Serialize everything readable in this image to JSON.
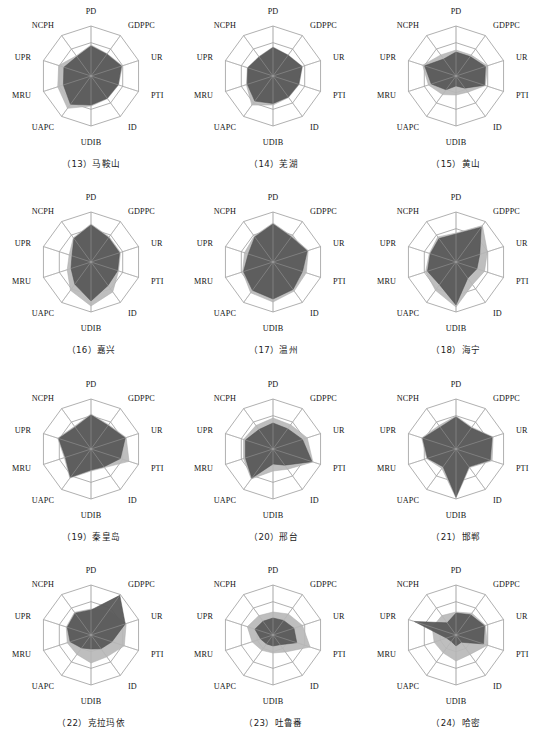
{
  "figure": {
    "type": "radar-grid",
    "rows": 4,
    "cols": 3,
    "axes": [
      "PD",
      "GDPPC",
      "UR",
      "PTI",
      "ID",
      "UDIB",
      "UAPC",
      "MRU",
      "UPR",
      "NCPH"
    ],
    "rings": 3,
    "colors": {
      "series_light": "#b9b9b9",
      "series_dark": "#585858",
      "grid": "#8e8e8e",
      "text": "#1a1a1a",
      "background": "#ffffff"
    },
    "series_names": [
      "light-series",
      "dark-series"
    ]
  },
  "chart_data": [
    {
      "type": "radar",
      "title": "（13）马鞍山",
      "index": "13",
      "name": "马鞍山",
      "categories": [
        "PD",
        "GDPPC",
        "UR",
        "PTI",
        "ID",
        "UDIB",
        "UAPC",
        "MRU",
        "UPR",
        "NCPH"
      ],
      "rmax": 1.0,
      "series": [
        {
          "name": "light-series",
          "values": [
            0.62,
            0.55,
            0.66,
            0.58,
            0.56,
            0.6,
            0.8,
            0.7,
            0.68,
            0.5
          ]
        },
        {
          "name": "dark-series",
          "values": [
            0.6,
            0.54,
            0.64,
            0.57,
            0.55,
            0.58,
            0.7,
            0.58,
            0.57,
            0.48
          ]
        }
      ]
    },
    {
      "type": "radar",
      "title": "（14）芜湖",
      "index": "14",
      "name": "芜湖",
      "categories": [
        "PD",
        "GDPPC",
        "UR",
        "PTI",
        "ID",
        "UDIB",
        "UAPC",
        "MRU",
        "UPR",
        "NCPH"
      ],
      "rmax": 1.0,
      "series": [
        {
          "name": "light-series",
          "values": [
            0.58,
            0.52,
            0.62,
            0.55,
            0.53,
            0.58,
            0.72,
            0.56,
            0.54,
            0.48
          ]
        },
        {
          "name": "dark-series",
          "values": [
            0.57,
            0.51,
            0.61,
            0.54,
            0.52,
            0.55,
            0.62,
            0.54,
            0.53,
            0.47
          ]
        }
      ]
    },
    {
      "type": "radar",
      "title": "（15）黄山",
      "index": "15",
      "name": "黄山",
      "categories": [
        "PD",
        "GDPPC",
        "UR",
        "PTI",
        "ID",
        "UDIB",
        "UAPC",
        "MRU",
        "UPR",
        "NCPH"
      ],
      "rmax": 1.0,
      "series": [
        {
          "name": "light-series",
          "values": [
            0.52,
            0.52,
            0.66,
            0.62,
            0.4,
            0.38,
            0.46,
            0.58,
            0.7,
            0.52
          ]
        },
        {
          "name": "dark-series",
          "values": [
            0.48,
            0.48,
            0.62,
            0.6,
            0.3,
            0.2,
            0.34,
            0.52,
            0.66,
            0.42
          ]
        }
      ]
    },
    {
      "type": "radar",
      "title": "（16）嘉兴",
      "index": "16",
      "name": "嘉兴",
      "categories": [
        "PD",
        "GDPPC",
        "UR",
        "PTI",
        "ID",
        "UDIB",
        "UAPC",
        "MRU",
        "UPR",
        "NCPH"
      ],
      "rmax": 1.0,
      "series": [
        {
          "name": "light-series",
          "values": [
            0.76,
            0.62,
            0.62,
            0.58,
            0.74,
            0.88,
            0.7,
            0.5,
            0.46,
            0.6
          ]
        },
        {
          "name": "dark-series",
          "values": [
            0.74,
            0.6,
            0.6,
            0.56,
            0.58,
            0.78,
            0.55,
            0.42,
            0.4,
            0.58
          ]
        }
      ]
    },
    {
      "type": "radar",
      "title": "（17）温州",
      "index": "17",
      "name": "温州",
      "categories": [
        "PD",
        "GDPPC",
        "UR",
        "PTI",
        "ID",
        "UDIB",
        "UAPC",
        "MRU",
        "UPR",
        "NCPH"
      ],
      "rmax": 1.0,
      "series": [
        {
          "name": "light-series",
          "values": [
            0.78,
            0.64,
            0.74,
            0.7,
            0.72,
            0.8,
            0.76,
            0.64,
            0.6,
            0.64
          ]
        },
        {
          "name": "dark-series",
          "values": [
            0.76,
            0.62,
            0.72,
            0.62,
            0.68,
            0.74,
            0.7,
            0.62,
            0.52,
            0.62
          ]
        }
      ]
    },
    {
      "type": "radar",
      "title": "（18）海宁",
      "index": "18",
      "name": "海宁",
      "categories": [
        "PD",
        "GDPPC",
        "UR",
        "PTI",
        "ID",
        "UDIB",
        "UAPC",
        "MRU",
        "UPR",
        "NCPH"
      ],
      "rmax": 1.0,
      "series": [
        {
          "name": "light-series",
          "values": [
            0.58,
            0.9,
            0.66,
            0.6,
            0.56,
            0.9,
            0.7,
            0.64,
            0.56,
            0.62
          ]
        },
        {
          "name": "dark-series",
          "values": [
            0.56,
            0.86,
            0.5,
            0.44,
            0.4,
            0.86,
            0.56,
            0.6,
            0.54,
            0.58
          ]
        }
      ]
    },
    {
      "type": "radar",
      "title": "（19）秦皇岛",
      "index": "19",
      "name": "秦皇岛",
      "categories": [
        "PD",
        "GDPPC",
        "UR",
        "PTI",
        "ID",
        "UDIB",
        "UAPC",
        "MRU",
        "UPR",
        "NCPH"
      ],
      "rmax": 1.0,
      "series": [
        {
          "name": "light-series",
          "values": [
            0.7,
            0.6,
            0.74,
            0.8,
            0.46,
            0.44,
            0.72,
            0.56,
            0.7,
            0.56
          ]
        },
        {
          "name": "dark-series",
          "values": [
            0.68,
            0.58,
            0.72,
            0.62,
            0.44,
            0.42,
            0.7,
            0.54,
            0.68,
            0.54
          ]
        }
      ]
    },
    {
      "type": "radar",
      "title": "（20）邢台",
      "index": "20",
      "name": "邢台",
      "categories": [
        "PD",
        "GDPPC",
        "UR",
        "PTI",
        "ID",
        "UDIB",
        "UAPC",
        "MRU",
        "UPR",
        "NCPH"
      ],
      "rmax": 1.0,
      "series": [
        {
          "name": "light-series",
          "values": [
            0.62,
            0.6,
            0.72,
            0.84,
            0.5,
            0.44,
            0.74,
            0.62,
            0.62,
            0.58
          ]
        },
        {
          "name": "dark-series",
          "values": [
            0.52,
            0.5,
            0.62,
            0.82,
            0.4,
            0.3,
            0.72,
            0.58,
            0.58,
            0.48
          ]
        }
      ]
    },
    {
      "type": "radar",
      "title": "（21）邯郸",
      "index": "21",
      "name": "邯郸",
      "categories": [
        "PD",
        "GDPPC",
        "UR",
        "PTI",
        "ID",
        "UDIB",
        "UAPC",
        "MRU",
        "UPR",
        "NCPH"
      ],
      "rmax": 1.0,
      "series": [
        {
          "name": "light-series",
          "values": [
            0.66,
            0.54,
            0.78,
            0.76,
            0.46,
            0.98,
            0.48,
            0.62,
            0.72,
            0.58
          ]
        },
        {
          "name": "dark-series",
          "values": [
            0.64,
            0.52,
            0.76,
            0.72,
            0.44,
            0.96,
            0.44,
            0.6,
            0.7,
            0.54
          ]
        }
      ]
    },
    {
      "type": "radar",
      "title": "（22）克拉玛依",
      "index": "22",
      "name": "克拉玛依",
      "categories": [
        "PD",
        "GDPPC",
        "UR",
        "PTI",
        "ID",
        "UDIB",
        "UAPC",
        "MRU",
        "UPR",
        "NCPH"
      ],
      "rmax": 1.0,
      "series": [
        {
          "name": "light-series",
          "values": [
            0.52,
            0.6,
            0.74,
            0.7,
            0.54,
            0.56,
            0.48,
            0.5,
            0.52,
            0.56
          ]
        },
        {
          "name": "dark-series",
          "values": [
            0.5,
            0.98,
            0.72,
            0.44,
            0.34,
            0.28,
            0.32,
            0.44,
            0.5,
            0.54
          ]
        }
      ]
    },
    {
      "type": "radar",
      "title": "（23）吐鲁番",
      "index": "23",
      "name": "吐鲁番",
      "categories": [
        "PD",
        "GDPPC",
        "UR",
        "PTI",
        "ID",
        "UDIB",
        "UAPC",
        "MRU",
        "UPR",
        "NCPH"
      ],
      "rmax": 1.0,
      "series": [
        {
          "name": "light-series",
          "values": [
            0.46,
            0.52,
            0.62,
            0.78,
            0.42,
            0.36,
            0.38,
            0.44,
            0.54,
            0.48
          ]
        },
        {
          "name": "dark-series",
          "values": [
            0.34,
            0.36,
            0.44,
            0.5,
            0.24,
            0.22,
            0.22,
            0.26,
            0.38,
            0.34
          ]
        }
      ]
    },
    {
      "type": "radar",
      "title": "（24）哈密",
      "index": "24",
      "name": "哈密",
      "categories": [
        "PD",
        "GDPPC",
        "UR",
        "PTI",
        "ID",
        "UDIB",
        "UAPC",
        "MRU",
        "UPR",
        "NCPH"
      ],
      "rmax": 1.0,
      "series": [
        {
          "name": "light-series",
          "values": [
            0.46,
            0.54,
            0.62,
            0.66,
            0.48,
            0.52,
            0.44,
            0.46,
            0.5,
            0.48
          ]
        },
        {
          "name": "dark-series",
          "values": [
            0.44,
            0.5,
            0.6,
            0.58,
            0.18,
            0.22,
            0.16,
            0.2,
            0.88,
            0.3
          ]
        }
      ]
    }
  ]
}
